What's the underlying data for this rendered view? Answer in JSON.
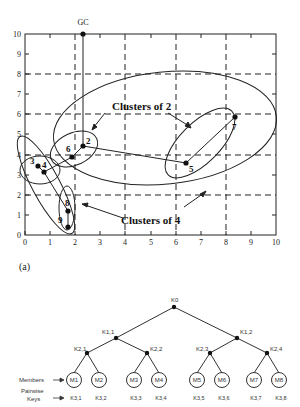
{
  "figure": {
    "panel_label": "(a)",
    "gc_label": "GC"
  },
  "plot": {
    "x_ticks": [
      "0",
      "1",
      "2",
      "3",
      "4",
      "5",
      "6",
      "7",
      "8",
      "9",
      "10"
    ],
    "y_ticks": [
      "0",
      "1",
      "2",
      "3",
      "4",
      "5",
      "6",
      "7",
      "8",
      "9",
      "10"
    ],
    "annotations": {
      "clusters_of_2": "Clusters of 2",
      "clusters_of_4": "Clusters of 4"
    },
    "nodes": [
      {
        "id": "2",
        "x": 2.4,
        "y": 4.4
      },
      {
        "id": "3",
        "x": 0.5,
        "y": 3.4
      },
      {
        "id": "4",
        "x": 0.8,
        "y": 3.1
      },
      {
        "id": "5",
        "x": 6.4,
        "y": 3.6
      },
      {
        "id": "6",
        "x": 1.9,
        "y": 3.9
      },
      {
        "id": "7",
        "x": 8.4,
        "y": 5.8
      },
      {
        "id": "8",
        "x": 1.7,
        "y": 1.2
      },
      {
        "id": "9",
        "x": 1.7,
        "y": 0.4
      }
    ],
    "gc": {
      "x": 2.3,
      "y": 10
    }
  },
  "tree": {
    "root": "K0",
    "level1": [
      "K1,1",
      "K1,2"
    ],
    "level2": [
      "K2,1",
      "K2,2",
      "K2,3",
      "K2,4"
    ],
    "members": [
      "M1",
      "M2",
      "M3",
      "M4",
      "M5",
      "M6",
      "M7",
      "M8"
    ],
    "pairwise_keys": [
      "K3,1",
      "K3,2",
      "K3,3",
      "K3,4",
      "K3,5",
      "K3,6",
      "K3,7",
      "K3,8"
    ],
    "legend": {
      "members": "Members",
      "pairwise": "Pairwise",
      "keys": "Keys"
    }
  }
}
